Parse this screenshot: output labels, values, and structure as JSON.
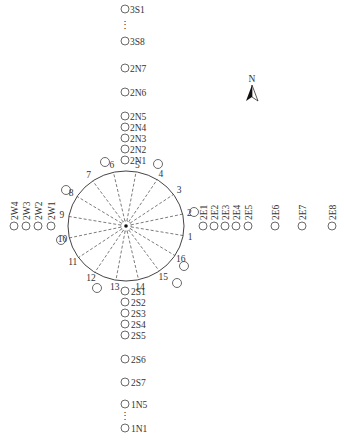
{
  "diagram": {
    "type": "sensor-layout",
    "north_label": "N",
    "center": {
      "x": 126,
      "y": 226
    },
    "circle": {
      "rx": 58,
      "ry": 55,
      "stroke": "#444444"
    },
    "radial_lines": 16,
    "circle_numbers": [
      "1",
      "2",
      "3",
      "4",
      "5",
      "6",
      "7",
      "8",
      "9",
      "10",
      "11",
      "12",
      "13",
      "14",
      "15",
      "16"
    ],
    "north_column": [
      {
        "label": "3S1",
        "y": 9
      },
      {
        "label": "3S8",
        "y": 41
      },
      {
        "label": "2N7",
        "y": 68
      },
      {
        "label": "2N6",
        "y": 92
      },
      {
        "label": "2N5",
        "y": 116
      },
      {
        "label": "2N4",
        "y": 127
      },
      {
        "label": "2N3",
        "y": 138
      },
      {
        "label": "2N2",
        "y": 149
      },
      {
        "label": "2N1",
        "y": 160
      }
    ],
    "south_column": [
      {
        "label": "2S1",
        "y": 291
      },
      {
        "label": "2S2",
        "y": 302
      },
      {
        "label": "2S3",
        "y": 313
      },
      {
        "label": "2S4",
        "y": 324
      },
      {
        "label": "2S5",
        "y": 335
      },
      {
        "label": "2S6",
        "y": 359
      },
      {
        "label": "2S7",
        "y": 382
      },
      {
        "label": "1N5",
        "y": 404
      },
      {
        "label": "1N1",
        "y": 428
      }
    ],
    "east_row": [
      {
        "label": "2E1",
        "x": 203
      },
      {
        "label": "2E2",
        "x": 214
      },
      {
        "label": "2E3",
        "x": 225
      },
      {
        "label": "2E4",
        "x": 236
      },
      {
        "label": "2E5",
        "x": 248
      },
      {
        "label": "2E6",
        "x": 275
      },
      {
        "label": "2E7",
        "x": 302
      },
      {
        "label": "2E8",
        "x": 332
      }
    ],
    "west_row": [
      {
        "label": "2W4",
        "x": 14
      },
      {
        "label": "2W3",
        "x": 26
      },
      {
        "label": "2W2",
        "x": 38
      },
      {
        "label": "2W1",
        "x": 51
      }
    ],
    "ring_points": [
      {
        "num": "1",
        "x": 194,
        "y": 212
      },
      {
        "num": "3",
        "x": 158,
        "y": 164
      },
      {
        "num": "5",
        "x": 105,
        "y": 162
      },
      {
        "num": "7",
        "x": 66,
        "y": 190
      },
      {
        "num": "9",
        "x": 61,
        "y": 240
      },
      {
        "num": "12",
        "x": 97,
        "y": 288
      },
      {
        "num": "13",
        "x": 177,
        "y": 283
      },
      {
        "num": "15",
        "x": 184,
        "y": 266
      }
    ],
    "ellipsis": "⋮"
  }
}
